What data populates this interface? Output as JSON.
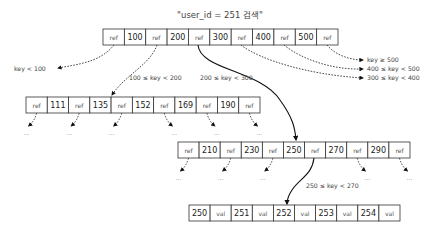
{
  "title": "\"user_id = 251 검색\"",
  "root_page": {
    "cells": [
      "ref",
      "100",
      "ref",
      "200",
      "ref",
      "300",
      "ref",
      "400",
      "ref",
      "500",
      "ref"
    ]
  },
  "left_page": {
    "cells": [
      "ref",
      "111",
      "ref",
      "135",
      "ref",
      "152",
      "ref",
      "169",
      "ref",
      "190",
      "ref"
    ]
  },
  "mid_page": {
    "cells": [
      "ref",
      "210",
      "ref",
      "230",
      "ref",
      "250",
      "ref",
      "270",
      "ref",
      "290",
      "ref"
    ]
  },
  "leaf_page": {
    "cells": [
      "250",
      "val",
      "251",
      "val",
      "252",
      "val",
      "253",
      "val",
      "254",
      "val"
    ]
  },
  "range_labels": {
    "lt100": "key < 100",
    "r100_200": "100 ≤ key < 200",
    "r200_300": "200 ≤ key < 300",
    "gte500": "key ≥ 500",
    "r400_500": "400 ≤ key < 500",
    "r300_400": "300 ≤ key < 400",
    "r250_270": "250 ≤ key < 270"
  },
  "ellipsis": "..."
}
